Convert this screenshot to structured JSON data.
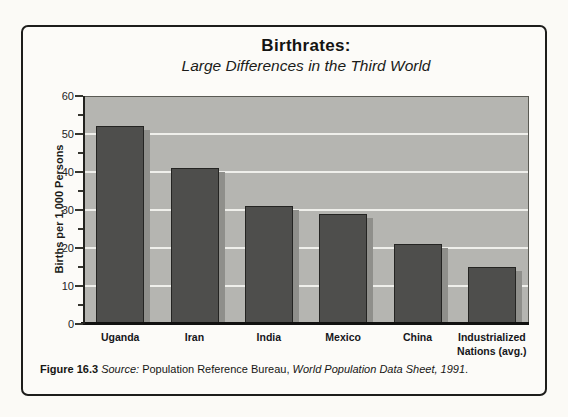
{
  "figure": {
    "title": "Birthrates:",
    "subtitle": "Large Differences in the Third World",
    "caption": {
      "label": "Figure 16.3",
      "source_label": "Source:",
      "publisher": "Population Reference Bureau,",
      "work": "World Population Data Sheet, 1991",
      "terminal": "."
    }
  },
  "chart_data": {
    "type": "bar",
    "title": "Birthrates:",
    "subtitle": "Large Differences in the Third World",
    "categories": [
      "Uganda",
      "Iran",
      "India",
      "Mexico",
      "China",
      "Industrialized Nations (avg.)"
    ],
    "values": [
      52,
      41,
      31,
      29,
      21,
      15
    ],
    "xlabel": "",
    "ylabel": "Births per 1,000 Persons",
    "ylim": [
      0,
      60
    ],
    "yticks": [
      0,
      10,
      20,
      30,
      40,
      50,
      60
    ],
    "minor_tick_step": 5,
    "gridline_values": [
      10,
      20,
      30,
      40,
      50
    ],
    "legend": "none",
    "grid": "horizontal light lines at major ticks 10-50",
    "colors": {
      "bar": "#4e4e4c",
      "bar_shadow": "#8f8f8b",
      "plot_background": "#b5b5b1",
      "gridline": "#efefeb",
      "axis": "#111110",
      "frame_border": "#1d1d1b"
    }
  }
}
